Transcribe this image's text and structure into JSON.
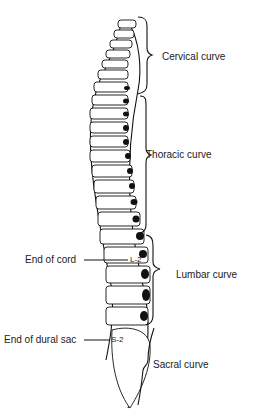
{
  "diagram": {
    "regions": [
      {
        "label": "Cervical curve"
      },
      {
        "label": "Thoracic curve"
      },
      {
        "label": "Lumbar curve"
      },
      {
        "label": "Sacral curve"
      }
    ],
    "markers": [
      {
        "label": "End of cord",
        "level": "L-2"
      },
      {
        "label": "End of dural sac",
        "level": "S-2"
      }
    ]
  }
}
